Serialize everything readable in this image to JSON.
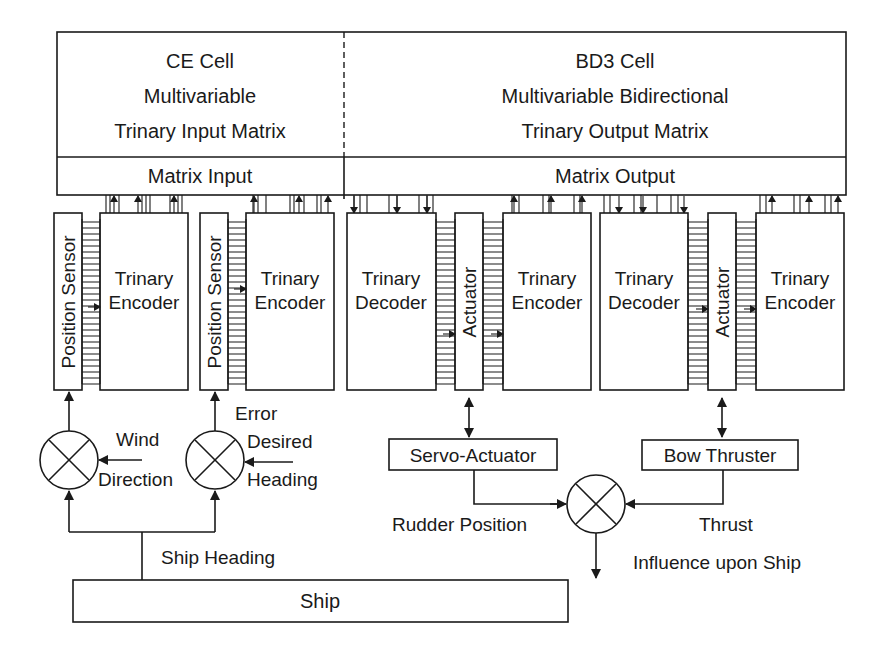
{
  "top_panel": {
    "left": {
      "title": "CE Cell",
      "line2": "Multivariable",
      "line3": "Trinary Input Matrix",
      "bar_label": "Matrix Input"
    },
    "right": {
      "title": "BD3 Cell",
      "line2": "Multivariable Bidirectional",
      "line3": "Trinary Output Matrix",
      "bar_label": "Matrix Output"
    }
  },
  "modules": {
    "sensor_1": {
      "sensor_label": "Position Sensor",
      "encoder_line1": "Trinary",
      "encoder_line2": "Encoder"
    },
    "sensor_2": {
      "sensor_label": "Position Sensor",
      "encoder_line1": "Trinary",
      "encoder_line2": "Encoder"
    },
    "actuator_1": {
      "decoder_line1": "Trinary",
      "decoder_line2": "Decoder",
      "actuator_label": "Actuator",
      "encoder_line1": "Trinary",
      "encoder_line2": "Encoder"
    },
    "actuator_2": {
      "decoder_line1": "Trinary",
      "decoder_line2": "Decoder",
      "actuator_label": "Actuator",
      "encoder_line1": "Trinary",
      "encoder_line2": "Encoder"
    }
  },
  "lower": {
    "wind_line1": "Wind",
    "wind_line2": "Direction",
    "error_label": "Error",
    "desired_line1": "Desired",
    "desired_line2": "Heading",
    "servo_label": "Servo-Actuator",
    "bow_label": "Bow Thruster",
    "rudder_label": "Rudder Position",
    "thrust_label": "Thrust",
    "influence_label": "Influence upon Ship",
    "ship_heading_label": "Ship Heading",
    "ship_label": "Ship"
  }
}
